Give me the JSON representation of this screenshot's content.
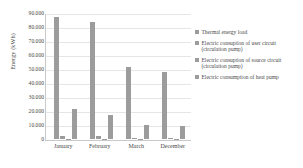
{
  "chart_data": {
    "type": "bar",
    "title": "",
    "xlabel": "",
    "ylabel": "Energy (kWh)",
    "categories": [
      "January",
      "February",
      "March",
      "December"
    ],
    "ylim": [
      0,
      90000
    ],
    "yticks": [
      0,
      10000,
      20000,
      30000,
      40000,
      50000,
      60000,
      70000,
      80000,
      90000
    ],
    "ytick_labels": [
      "0",
      "10.000",
      "20.000",
      "30.000",
      "40.000",
      "50.000",
      "60.000",
      "70.000",
      "80.000",
      "90.000"
    ],
    "grid": true,
    "legend_position": "right",
    "series": [
      {
        "name": "Thermal energy load",
        "color": "#9c9c9c",
        "values": [
          88000,
          84000,
          52000,
          48000
        ]
      },
      {
        "name": "Electric consuption of user circuit (circulation pump)",
        "color": "#9c9c9c",
        "values": [
          2300,
          2200,
          700,
          600
        ]
      },
      {
        "name": "Electric consuption of source circuit (circulation pump)",
        "color": "#9c9c9c",
        "values": [
          300,
          300,
          150,
          120
        ]
      },
      {
        "name": "Electric consumption of heat pump",
        "color": "#9c9c9c",
        "values": [
          21500,
          17000,
          10000,
          9300
        ]
      }
    ]
  },
  "axis": {
    "y_title": "Energy (kWh)"
  },
  "legend": {
    "items": [
      {
        "label": "Thermal energy load"
      },
      {
        "label": "Electric consuption of user circuit (circulation pump)"
      },
      {
        "label": "Electric consuption of source circuit (circulation pump)"
      },
      {
        "label": "Electric consumption of heat pump"
      }
    ]
  }
}
